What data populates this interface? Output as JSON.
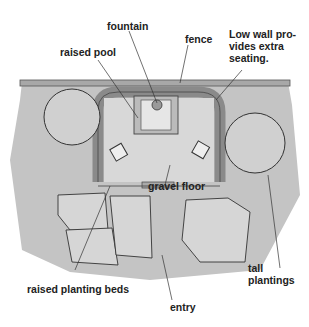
{
  "diagram": {
    "labels": {
      "fountain": "fountain",
      "fence": "fence",
      "raised_pool": "raised pool",
      "low_wall_1": "Low wall pro-",
      "low_wall_2": "vides extra",
      "low_wall_3": "seating.",
      "gravel_floor": "gravel floor",
      "tall_1": "tall",
      "tall_2": "plantings",
      "raised_beds": "raised planting beds",
      "entry": "entry"
    },
    "colors": {
      "ground": "#bdbdbd",
      "wall": "#9e9e9e",
      "line": "#333333",
      "text": "#222222"
    }
  }
}
